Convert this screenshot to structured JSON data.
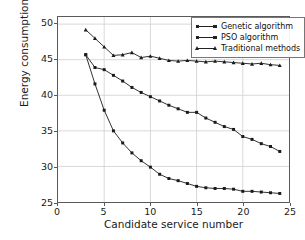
{
  "chart_data": {
    "type": "line",
    "title": "",
    "xlabel": "Candidate service number",
    "ylabel": "Energy consumption(J)",
    "xlim": [
      0,
      25
    ],
    "ylim": [
      25,
      51
    ],
    "xticks": [
      0,
      5,
      10,
      15,
      20,
      25
    ],
    "yticks": [
      25,
      30,
      35,
      40,
      45,
      50
    ],
    "grid": true,
    "legend_position": "upper right",
    "x": [
      3,
      4,
      5,
      6,
      7,
      8,
      9,
      10,
      11,
      12,
      13,
      14,
      15,
      16,
      17,
      18,
      19,
      20,
      21,
      22,
      23,
      24
    ],
    "series": [
      {
        "name": "Genetic algorithm",
        "marker": "square",
        "color": "#1a1a1a",
        "values": [
          45.7,
          41.6,
          37.9,
          35.0,
          33.3,
          31.9,
          30.8,
          29.9,
          28.9,
          28.3,
          28.0,
          27.6,
          27.2,
          27.0,
          26.9,
          26.9,
          26.8,
          26.5,
          26.5,
          26.4,
          26.3,
          26.2
        ]
      },
      {
        "name": "PSO algorithm",
        "marker": "square",
        "color": "#1a1a1a",
        "values": [
          45.7,
          43.9,
          43.6,
          42.8,
          42.0,
          41.1,
          40.4,
          39.8,
          39.2,
          38.6,
          38.1,
          37.6,
          37.6,
          36.8,
          36.2,
          35.6,
          35.2,
          34.2,
          33.8,
          33.2,
          32.8,
          32.1
        ]
      },
      {
        "name": "Traditional methods",
        "marker": "triangle",
        "color": "#1a1a1a",
        "values": [
          49.2,
          48.0,
          46.8,
          45.6,
          45.7,
          46.0,
          45.3,
          45.5,
          45.2,
          44.9,
          44.8,
          44.9,
          44.8,
          44.7,
          44.8,
          44.7,
          44.6,
          44.5,
          44.4,
          44.5,
          44.3,
          44.2
        ]
      }
    ]
  },
  "axes": {
    "x_tick_labels": [
      "0",
      "5",
      "10",
      "15",
      "20",
      "25"
    ],
    "y_tick_labels": [
      "25",
      "30",
      "35",
      "40",
      "45",
      "50"
    ]
  },
  "legend": {
    "entries": [
      {
        "label": "Genetic algorithm",
        "marker": "square"
      },
      {
        "label": "PSO algorithm",
        "marker": "square"
      },
      {
        "label": "Traditional methods",
        "marker": "triangle"
      }
    ]
  },
  "style": {
    "line_color": "#1a1a1a",
    "grid_color": "#cfcfcf",
    "frame_color": "#5a5a5a",
    "background": "#ffffff"
  }
}
